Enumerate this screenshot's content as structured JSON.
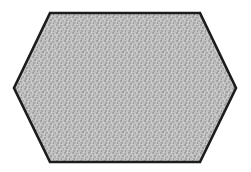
{
  "canvas": {
    "width": 251,
    "height": 172,
    "background_color": "#ffffff",
    "description": "White canvas containing a single filled hexagon outline drawing"
  },
  "shape": {
    "name": "hexagon",
    "label": "elongated-hexagon",
    "sides": 6,
    "orientation": "horizontal (flat top and bottom, pointed left and right)",
    "stroke_color": "#1c1c1c",
    "stroke_width": 2.6,
    "fill_color": "#b9b9b9",
    "fill_style": "stippled-gray-texture",
    "vertices": [
      {
        "name": "top-left",
        "x": 50,
        "y": 13
      },
      {
        "name": "top-right",
        "x": 200,
        "y": 13
      },
      {
        "name": "right",
        "x": 236,
        "y": 88
      },
      {
        "name": "bottom-right",
        "x": 200,
        "y": 162
      },
      {
        "name": "bottom-left",
        "x": 50,
        "y": 162
      },
      {
        "name": "left",
        "x": 14,
        "y": 88
      }
    ],
    "points_string": "50,13 200,13 236,88 200,162 50,162 14,88",
    "bounding_box": {
      "x": 14,
      "y": 13,
      "width": 222,
      "height": 149
    }
  },
  "texture": {
    "name": "noise-fill",
    "base_color": "#bdbdbd",
    "speckle_dark": "#9a9a9a",
    "speckle_light": "#d2d2d2",
    "cell_size_px": 2,
    "description": "Fine random dithered halftone speckle averaging to medium gray"
  }
}
